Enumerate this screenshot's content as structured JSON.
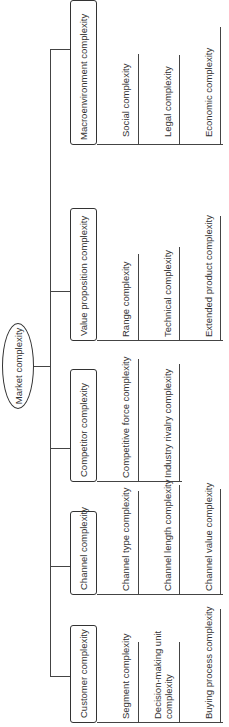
{
  "root": {
    "label": "Market complexity"
  },
  "categories": [
    {
      "label": "Customer complexity",
      "items": [
        "Segment complexity",
        "Decision-making unit complexity",
        "Buying process complexity"
      ]
    },
    {
      "label": "Channel complexity",
      "items": [
        "Channel type complexity",
        "Channel length complexity",
        "Channel value complexity"
      ]
    },
    {
      "label": "Competitor complexity",
      "items": [
        "Competitive force complexity",
        "Industry rivalry complexity"
      ]
    },
    {
      "label": "Value proposition complexity",
      "items": [
        "Range complexity",
        "Technical complexity",
        "Extended product complexity"
      ]
    },
    {
      "label": "Macroenvironment complexity",
      "items": [
        "Social complexity",
        "Legal complexity",
        "Economic complexity"
      ]
    }
  ]
}
